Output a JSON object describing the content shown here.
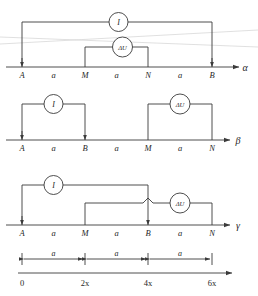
{
  "figure": {
    "title": ""
  },
  "diagrams": [
    {
      "id": "alpha",
      "axis_label": "α",
      "electrodes": [
        {
          "name": "A",
          "x_frac": 0.0
        },
        {
          "name": "M",
          "x_frac": 0.3333
        },
        {
          "name": "N",
          "x_frac": 0.6667
        },
        {
          "name": "B",
          "x_frac": 1.0
        }
      ],
      "spacings": [
        "a",
        "a",
        "a"
      ],
      "meters": [
        {
          "name": "I",
          "label": "I",
          "from": "A",
          "to": "B"
        },
        {
          "name": "dU",
          "label": "ΔU",
          "from": "M",
          "to": "N"
        }
      ]
    },
    {
      "id": "beta",
      "axis_label": "β",
      "electrodes": [
        {
          "name": "A",
          "x_frac": 0.0
        },
        {
          "name": "B",
          "x_frac": 0.3333
        },
        {
          "name": "M",
          "x_frac": 0.6667
        },
        {
          "name": "N",
          "x_frac": 1.0
        }
      ],
      "spacings": [
        "a",
        "a",
        "a"
      ],
      "meters": [
        {
          "name": "I",
          "label": "I",
          "from": "A",
          "to": "B"
        },
        {
          "name": "dU",
          "label": "ΔU",
          "from": "M",
          "to": "N"
        }
      ]
    },
    {
      "id": "gamma",
      "axis_label": "γ",
      "electrodes": [
        {
          "name": "A",
          "x_frac": 0.0
        },
        {
          "name": "M",
          "x_frac": 0.3333
        },
        {
          "name": "B",
          "x_frac": 0.6667
        },
        {
          "name": "N",
          "x_frac": 1.0
        }
      ],
      "spacings": [
        "a",
        "a",
        "a"
      ],
      "meters": [
        {
          "name": "I",
          "label": "I",
          "from": "A",
          "to": "B"
        },
        {
          "name": "dU",
          "label": "ΔU",
          "from": "M",
          "to": "N"
        }
      ]
    }
  ],
  "scale": {
    "dimension_labels": [
      "a",
      "a",
      "a"
    ],
    "tick_labels": [
      "0",
      "2x",
      "4x",
      "6x"
    ]
  },
  "colors": {
    "line": "#3a3a3a",
    "text": "#1f1f1f",
    "background": "#ffffff"
  }
}
